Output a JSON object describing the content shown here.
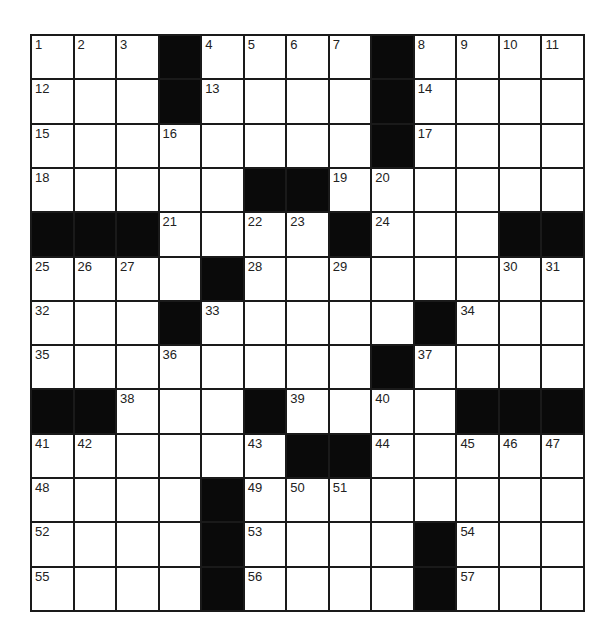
{
  "puzzle": {
    "rows": 13,
    "cols": 13,
    "grid": [
      [
        "1",
        "2",
        "3",
        "#",
        "4",
        "5",
        "6",
        "7",
        "#",
        "8",
        "9",
        "10",
        "11"
      ],
      [
        "12",
        "",
        "",
        "#",
        "13",
        "",
        "",
        "",
        "#",
        "14",
        "",
        "",
        ""
      ],
      [
        "15",
        "",
        "",
        "16",
        "",
        "",
        "",
        "",
        "#",
        "17",
        "",
        "",
        ""
      ],
      [
        "18",
        "",
        "",
        "",
        "",
        "#",
        "#",
        "19",
        "20",
        "",
        "",
        "",
        ""
      ],
      [
        "#",
        "#",
        "#",
        "21",
        "",
        "22",
        "23",
        "#",
        "24",
        "",
        "",
        "#",
        "#"
      ],
      [
        "25",
        "26",
        "27",
        "",
        "#",
        "28",
        "",
        "29",
        "",
        "",
        "",
        "30",
        "31"
      ],
      [
        "32",
        "",
        "",
        "#",
        "33",
        "",
        "",
        "",
        "",
        "#",
        "34",
        "",
        ""
      ],
      [
        "35",
        "",
        "",
        "36",
        "",
        "",
        "",
        "",
        "#",
        "37",
        "",
        "",
        ""
      ],
      [
        "#",
        "#",
        "38",
        "",
        "",
        "#",
        "39",
        "",
        "40",
        "",
        "#",
        "#",
        "#"
      ],
      [
        "41",
        "42",
        "",
        "",
        "",
        "43",
        "#",
        "#",
        "44",
        "",
        "45",
        "46",
        "47"
      ],
      [
        "48",
        "",
        "",
        "",
        "#",
        "49",
        "50",
        "51",
        "",
        "",
        "",
        "",
        ""
      ],
      [
        "52",
        "",
        "",
        "",
        "#",
        "53",
        "",
        "",
        "",
        "#",
        "54",
        "",
        ""
      ],
      [
        "55",
        "",
        "",
        "",
        "#",
        "56",
        "",
        "",
        "",
        "#",
        "57",
        "",
        ""
      ]
    ]
  }
}
